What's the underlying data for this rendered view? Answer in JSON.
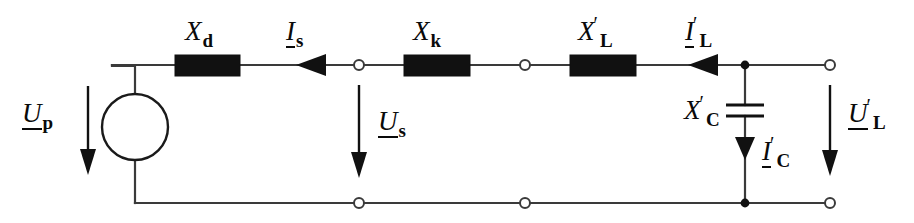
{
  "diagram": {
    "type": "electrical-circuit-schematic",
    "colors": {
      "wire": "#3a3a3a",
      "component_fill": "#111111",
      "background": "#ffffff",
      "text": "#0a0a0a"
    },
    "labels": {
      "source_voltage": {
        "base": "U",
        "underline": true,
        "prime": "",
        "sub": "p",
        "text": "U_p"
      },
      "sync_reactance": {
        "base": "X",
        "underline": false,
        "prime": "",
        "sub": "d",
        "text": "X_d"
      },
      "source_current": {
        "base": "I",
        "underline": true,
        "prime": "",
        "sub": "s",
        "text": "I_s"
      },
      "short_circuit_reactance": {
        "base": "X",
        "underline": false,
        "prime": "",
        "sub": "k",
        "text": "X_k"
      },
      "bus_voltage": {
        "base": "U",
        "underline": true,
        "prime": "",
        "sub": "s",
        "text": "U_s"
      },
      "line_reactance": {
        "base": "X",
        "underline": false,
        "prime": "′",
        "sub": "L",
        "text": "X'_L"
      },
      "line_current": {
        "base": "I",
        "underline": true,
        "prime": "′",
        "sub": "L",
        "text": "I'_L"
      },
      "shunt_capacitance": {
        "base": "X",
        "underline": false,
        "prime": "′",
        "sub": "C",
        "text": "X'_C"
      },
      "capacitor_current": {
        "base": "I",
        "underline": true,
        "prime": "′",
        "sub": "C",
        "text": "I'_C"
      },
      "load_voltage": {
        "base": "U",
        "underline": true,
        "prime": "′",
        "sub": "L",
        "text": "U'_L"
      }
    },
    "components": {
      "voltage_source": {
        "shape": "circle",
        "cx": 135,
        "cy": 127,
        "r": 33
      },
      "reactance_boxes": [
        {
          "name": "X_d",
          "x": 175,
          "y": 55,
          "w": 65,
          "h": 21
        },
        {
          "name": "X_k",
          "x": 404,
          "y": 55,
          "w": 66,
          "h": 21
        },
        {
          "name": "X_L_prime",
          "x": 570,
          "y": 55,
          "w": 66,
          "h": 21
        }
      ],
      "capacitor": {
        "cx": 745,
        "plate_top_y": 105,
        "plate_bottom_y": 116,
        "plate_half_width": 19
      },
      "open_nodes": [
        {
          "x": 359,
          "y": 65
        },
        {
          "x": 525,
          "y": 65
        },
        {
          "x": 830,
          "y": 65
        },
        {
          "x": 359,
          "y": 203
        },
        {
          "x": 525,
          "y": 203
        },
        {
          "x": 830,
          "y": 203
        }
      ],
      "junction_dots": [
        {
          "x": 745,
          "y": 65
        },
        {
          "x": 745,
          "y": 203
        }
      ]
    },
    "arrows": {
      "current_arrows": [
        {
          "name": "I_s",
          "direction": "left",
          "x_tip": 296,
          "y": 65
        },
        {
          "name": "I_L_prime",
          "direction": "left",
          "x_tip": 688,
          "y": 65
        },
        {
          "name": "I_C_prime",
          "direction": "down",
          "x": 745,
          "y_tip": 158
        }
      ],
      "voltage_arrows": [
        {
          "name": "U_p",
          "direction": "down",
          "x": 88,
          "y_start": 86,
          "y_tip": 173
        },
        {
          "name": "U_s",
          "direction": "down",
          "x": 359,
          "y_start": 85,
          "y_tip": 176
        },
        {
          "name": "U_L_prime",
          "direction": "down",
          "x": 830,
          "y_start": 85,
          "y_tip": 174
        }
      ]
    },
    "rails": {
      "top_y": 65,
      "bottom_y": 203,
      "left_x": 112,
      "right_x": 830
    }
  }
}
